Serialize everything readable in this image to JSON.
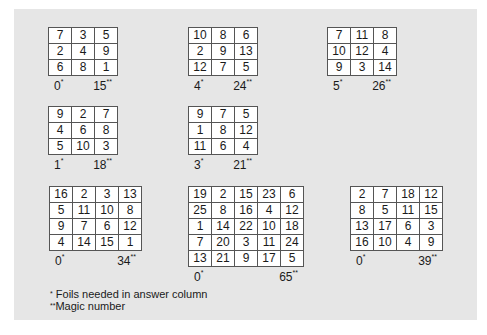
{
  "squares": [
    {
      "rows": [
        [
          7,
          3,
          5
        ],
        [
          2,
          4,
          9
        ],
        [
          6,
          8,
          1
        ]
      ],
      "foils": "0",
      "magic": "15"
    },
    {
      "rows": [
        [
          10,
          8,
          6
        ],
        [
          2,
          9,
          13
        ],
        [
          12,
          7,
          5
        ]
      ],
      "foils": "4",
      "magic": "24"
    },
    {
      "rows": [
        [
          7,
          11,
          8
        ],
        [
          10,
          12,
          4
        ],
        [
          9,
          3,
          14
        ]
      ],
      "foils": "5",
      "magic": "26"
    },
    {
      "rows": [
        [
          9,
          2,
          7
        ],
        [
          4,
          6,
          8
        ],
        [
          5,
          10,
          3
        ]
      ],
      "foils": "1",
      "magic": "18"
    },
    {
      "rows": [
        [
          9,
          7,
          5
        ],
        [
          1,
          8,
          12
        ],
        [
          11,
          6,
          4
        ]
      ],
      "foils": "3",
      "magic": "21"
    },
    {
      "rows": [
        [
          16,
          2,
          3,
          13
        ],
        [
          5,
          11,
          10,
          8
        ],
        [
          9,
          7,
          6,
          12
        ],
        [
          4,
          14,
          15,
          1
        ]
      ],
      "foils": "0",
      "magic": "34"
    },
    {
      "rows": [
        [
          19,
          2,
          15,
          23,
          6
        ],
        [
          25,
          8,
          16,
          4,
          12
        ],
        [
          1,
          14,
          22,
          10,
          18
        ],
        [
          7,
          20,
          3,
          11,
          24
        ],
        [
          13,
          21,
          9,
          17,
          5
        ]
      ],
      "foils": "0",
      "magic": "65"
    },
    {
      "rows": [
        [
          2,
          7,
          18,
          12
        ],
        [
          8,
          5,
          11,
          15
        ],
        [
          13,
          17,
          6,
          3
        ],
        [
          16,
          10,
          4,
          9
        ]
      ],
      "foils": "0",
      "magic": "39"
    }
  ],
  "marks": {
    "single": "*",
    "double": "**"
  },
  "legend": {
    "foils_note": "Foils needed in answer column",
    "magic_note": "Magic number"
  },
  "colors": {
    "panel": "#e6e6e6",
    "cell": "#ffffff",
    "border": "#555555"
  }
}
